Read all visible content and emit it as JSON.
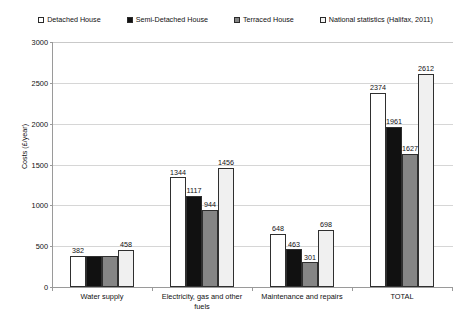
{
  "chart_data": {
    "type": "bar",
    "title": "",
    "xlabel": "",
    "ylabel": "Costs (£/year)",
    "ylim": [
      0,
      3000
    ],
    "ytick_step": 500,
    "yticks": [
      "0",
      "500",
      "1000",
      "1500",
      "2000",
      "2500",
      "3000"
    ],
    "grid": true,
    "legend_position": "top",
    "categories": [
      "Water supply",
      "Electricity, gas and other fuels",
      "Maintenance and repairs",
      "TOTAL"
    ],
    "category_lines": [
      [
        "Water supply"
      ],
      [
        "Electricity, gas and other",
        "fuels"
      ],
      [
        "Maintenance and repairs"
      ],
      [
        "TOTAL"
      ]
    ],
    "series": [
      {
        "name": "Detached House",
        "color": "#ffffff",
        "values": [
          382,
          1344,
          648,
          2374
        ],
        "labels": [
          "382",
          "1344",
          "648",
          "2374"
        ]
      },
      {
        "name": "Semi-Detached House",
        "color": "#111111",
        "values": [
          382,
          1117,
          463,
          1961
        ],
        "labels": [
          "",
          "1117",
          "463",
          "1961"
        ]
      },
      {
        "name": "Terraced House",
        "color": "#858585",
        "values": [
          382,
          944,
          301,
          1627
        ],
        "labels": [
          "",
          "944",
          "301",
          "1627"
        ]
      },
      {
        "name": "National statistics (Halifax, 2011)",
        "color": "#f0f0f0",
        "values": [
          458,
          1456,
          698,
          2612
        ],
        "labels": [
          "458",
          "1456",
          "698",
          "2612"
        ]
      }
    ]
  },
  "legend": {
    "items": [
      {
        "label": "Detached House",
        "swatch": "#ffffff"
      },
      {
        "label": "Semi-Detached House",
        "swatch": "#111111"
      },
      {
        "label": "Terraced House",
        "swatch": "#858585"
      },
      {
        "label": "National statistics (Halifax, 2011)",
        "swatch": "#f5f5f5"
      }
    ]
  },
  "axes": {
    "y_title": "Costs (£/year)"
  }
}
